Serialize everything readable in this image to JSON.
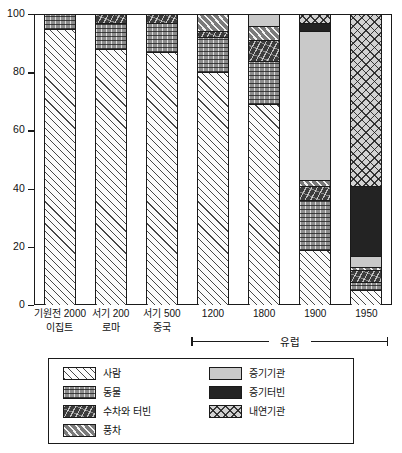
{
  "chart_data": {
    "type": "bar",
    "subtype": "stacked-100-percent",
    "title": "",
    "xlabel": "",
    "ylabel": "",
    "ylim": [
      0,
      100
    ],
    "yticks": [
      0,
      20,
      40,
      60,
      80,
      100
    ],
    "grid": false,
    "legend_position": "bottom",
    "categories": [
      "기원전 2000\n이집트",
      "서기 200\n로마",
      "서기 500\n중국",
      "1200",
      "1800",
      "1900",
      "1950"
    ],
    "category_lines": [
      {
        "line1": "기원전 2000",
        "line2": "이집트"
      },
      {
        "line1": "서기 200",
        "line2": "로마"
      },
      {
        "line1": "서기 500",
        "line2": "중국"
      },
      {
        "line1": "1200",
        "line2": ""
      },
      {
        "line1": "1800",
        "line2": ""
      },
      {
        "line1": "1900",
        "line2": ""
      },
      {
        "line1": "1950",
        "line2": ""
      }
    ],
    "series": [
      {
        "name": "사람",
        "pattern": "diagonal-hatch-light",
        "color": "#fbfbfb",
        "values": [
          95,
          88,
          87,
          80,
          69,
          19,
          5
        ]
      },
      {
        "name": "동물",
        "pattern": "brick-dots-gray",
        "color": "#8d8d8d",
        "values": [
          5,
          9,
          10,
          12,
          15,
          17,
          3
        ]
      },
      {
        "name": "수차와 터빈",
        "pattern": "dark-marks",
        "color": "#3c3c3c",
        "values": [
          0,
          3,
          3,
          2,
          7,
          5,
          4
        ]
      },
      {
        "name": "풍차",
        "pattern": "diagonal-hatch-dark",
        "color": "#7b7b7b",
        "values": [
          0,
          0,
          0,
          6,
          5,
          2,
          1
        ]
      },
      {
        "name": "증기기관",
        "pattern": "solid-light-gray",
        "color": "#c9c9c9",
        "values": [
          0,
          0,
          0,
          0,
          4,
          51,
          4
        ]
      },
      {
        "name": "증기터빈",
        "pattern": "solid-black",
        "color": "#232323",
        "values": [
          0,
          0,
          0,
          0,
          0,
          3,
          24
        ]
      },
      {
        "name": "내연기관",
        "pattern": "cross-hatch",
        "color": "#d2d2d2",
        "values": [
          0,
          0,
          0,
          0,
          0,
          3,
          59
        ]
      }
    ],
    "annotations": [
      {
        "text": "유럽",
        "spans_categories": [
          "1200",
          "1800",
          "1900",
          "1950"
        ]
      }
    ]
  },
  "axis": {
    "y_tick_labels": [
      "100",
      "80",
      "60",
      "40",
      "20",
      "0"
    ]
  },
  "legend": {
    "items": [
      {
        "label": "사람",
        "pattern_class": "p-saram"
      },
      {
        "label": "동물",
        "pattern_class": "p-dongmul"
      },
      {
        "label": "수차와 터빈",
        "pattern_class": "p-suchalink"
      },
      {
        "label": "풍차",
        "pattern_class": "p-pungcha"
      },
      {
        "label": "증기기관",
        "pattern_class": "p-jeunggi"
      },
      {
        "label": "증기터빈",
        "pattern_class": "p-jeunggiteobin"
      },
      {
        "label": "내연기관",
        "pattern_class": "p-naeyeon"
      }
    ]
  },
  "europe": {
    "label": "유럽"
  }
}
